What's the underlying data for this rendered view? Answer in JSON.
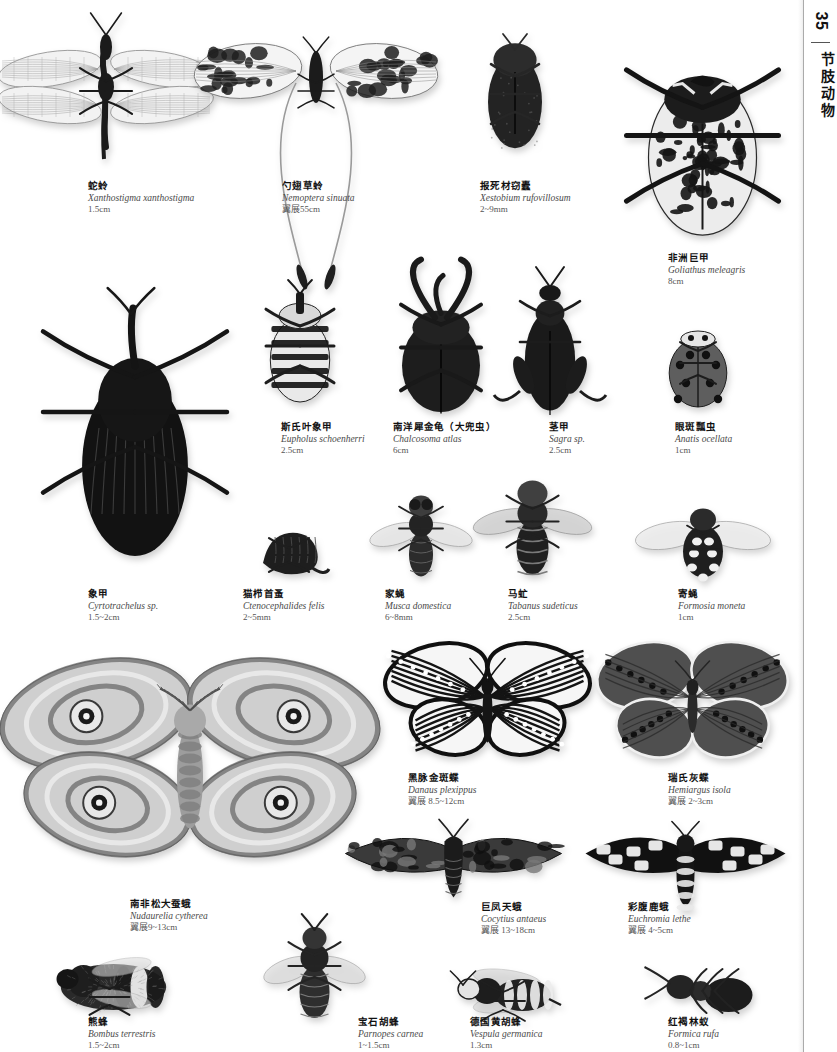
{
  "page": {
    "number": "35",
    "section_label": "节肢动物",
    "background_color": "#ffffff",
    "text_color": "#111111",
    "accent_gray": "#4a4a4a"
  },
  "specimens": [
    {
      "id": "snakefly",
      "cn": "蛇蛉",
      "la": "Xanthostigma xanthostigma",
      "size": "1.5cm",
      "caption_x": 88,
      "caption_y": 180,
      "art_x": 6,
      "art_y": 12,
      "art_w": 200,
      "art_h": 150,
      "kind": "lacewing"
    },
    {
      "id": "spoonwing-lacewing",
      "cn": "勺翅草蛉",
      "la": "Nemoptera sinuata",
      "size": "翼展55cm",
      "caption_x": 282,
      "caption_y": 180,
      "art_x": 196,
      "art_y": 8,
      "art_w": 240,
      "art_h": 230,
      "kind": "nemoptera"
    },
    {
      "id": "deathwatch-beetle",
      "cn": "报死材窃蠹",
      "la": "Xestobium rufovillosum",
      "size": "2~9mm",
      "caption_x": 480,
      "caption_y": 180,
      "art_x": 470,
      "art_y": 20,
      "art_w": 90,
      "art_h": 140,
      "kind": "beetle-dark"
    },
    {
      "id": "goliath-beetle",
      "cn": "非洲巨甲",
      "la": "Goliathus meleagris",
      "size": "8cm",
      "caption_x": 668,
      "caption_y": 252,
      "art_x": 590,
      "art_y": 12,
      "art_w": 225,
      "art_h": 235,
      "kind": "goliath"
    },
    {
      "id": "eupholus-weevil",
      "cn": "斯氏叶象甲",
      "la": "Eupholus schoenherri",
      "size": "2.5cm",
      "caption_x": 281,
      "caption_y": 421,
      "art_x": 245,
      "art_y": 272,
      "art_w": 110,
      "art_h": 140,
      "kind": "weevil-banded"
    },
    {
      "id": "atlas-beetle",
      "cn": "南洋犀金龟（大兜虫）",
      "la": "Chalcosoma atlas",
      "size": "6cm",
      "caption_x": 393,
      "caption_y": 421,
      "art_x": 376,
      "art_y": 258,
      "art_w": 130,
      "art_h": 155,
      "kind": "atlas"
    },
    {
      "id": "sagra-beetle",
      "cn": "茎甲",
      "la": "Sagra sp.",
      "size": "2.5cm",
      "caption_x": 549,
      "caption_y": 421,
      "art_x": 490,
      "art_y": 255,
      "art_w": 120,
      "art_h": 160,
      "kind": "sagra"
    },
    {
      "id": "eyed-ladybird",
      "cn": "眼斑瓢虫",
      "la": "Anatis ocellata",
      "size": "1cm",
      "caption_x": 675,
      "caption_y": 421,
      "art_x": 650,
      "art_y": 315,
      "art_w": 96,
      "art_h": 100,
      "kind": "ladybird"
    },
    {
      "id": "palm-weevil",
      "cn": "象甲",
      "la": "Cyrtotrachelus sp.",
      "size": "1.5~2cm",
      "caption_x": 88,
      "caption_y": 588,
      "art_x": 20,
      "art_y": 272,
      "art_w": 230,
      "art_h": 300,
      "kind": "bigweevil"
    },
    {
      "id": "cat-flea",
      "cn": "猫栉首蚤",
      "la": "Ctenocephalides felis",
      "size": "2~5mm",
      "caption_x": 243,
      "caption_y": 588,
      "art_x": 248,
      "art_y": 512,
      "art_w": 82,
      "art_h": 70,
      "kind": "flea"
    },
    {
      "id": "house-fly",
      "cn": "家蝇",
      "la": "Musca domestica",
      "size": "6~8mm",
      "caption_x": 385,
      "caption_y": 588,
      "art_x": 376,
      "art_y": 478,
      "art_w": 90,
      "art_h": 105,
      "kind": "fly"
    },
    {
      "id": "horse-fly",
      "cn": "马虻",
      "la": "Tabanus sudeticus",
      "size": "2.5cm",
      "caption_x": 508,
      "caption_y": 588,
      "art_x": 480,
      "art_y": 468,
      "art_w": 105,
      "art_h": 115,
      "kind": "horsefly"
    },
    {
      "id": "tachinid-fly",
      "cn": "寄蝇",
      "la": "Formosia moneta",
      "size": "1cm",
      "caption_x": 678,
      "caption_y": 588,
      "art_x": 648,
      "art_y": 490,
      "art_w": 110,
      "art_h": 95,
      "kind": "tachinid"
    },
    {
      "id": "pine-emperor-moth",
      "cn": "南非松大蚕蛾",
      "la": "Nudaurelia cytherea",
      "size": "翼展9~13cm",
      "caption_x": 130,
      "caption_y": 898,
      "art_x": 0,
      "art_y": 628,
      "art_w": 380,
      "art_h": 265,
      "kind": "emperor-moth"
    },
    {
      "id": "monarch-butterfly",
      "cn": "黑脉金斑蝶",
      "la": "Danaus plexippus",
      "size": "翼展 8.5~12cm",
      "caption_x": 408,
      "caption_y": 772,
      "art_x": 385,
      "art_y": 635,
      "art_w": 205,
      "art_h": 135,
      "kind": "monarch"
    },
    {
      "id": "reakirts-blue",
      "cn": "瑞氏灰蝶",
      "la": "Hemiargus isola",
      "size": "翼展 2~3cm",
      "caption_x": 668,
      "caption_y": 772,
      "art_x": 600,
      "art_y": 638,
      "art_w": 185,
      "art_h": 130,
      "kind": "blue-butterfly"
    },
    {
      "id": "giant-sphinx-moth",
      "cn": "巨凤天蛾",
      "la": "Cocytius antaeus",
      "size": "翼展 13~18cm",
      "caption_x": 481,
      "caption_y": 901,
      "art_x": 336,
      "art_y": 808,
      "art_w": 235,
      "art_h": 95,
      "kind": "sphinx-moth"
    },
    {
      "id": "euchromia-moth",
      "cn": "彩腹鹿蛾",
      "la": "Euchromia lethe",
      "size": "翼展 4~5cm",
      "caption_x": 628,
      "caption_y": 901,
      "art_x": 578,
      "art_y": 810,
      "art_w": 215,
      "art_h": 95,
      "kind": "tiger-moth"
    },
    {
      "id": "buff-tailed-bumblebee",
      "cn": "熊蜂",
      "la": "Bombus terrestris",
      "size": "1.5~2cm",
      "caption_x": 88,
      "caption_y": 1016,
      "art_x": 28,
      "art_y": 948,
      "art_w": 155,
      "art_h": 70,
      "kind": "bumblebee"
    },
    {
      "id": "jewel-wasp",
      "cn": "宝石胡蜂",
      "la": "Parnopes carnea",
      "size": "1~1.5cm",
      "caption_x": 358,
      "caption_y": 1016,
      "art_x": 262,
      "art_y": 908,
      "art_w": 105,
      "art_h": 112,
      "kind": "jewel-wasp"
    },
    {
      "id": "german-wasp",
      "cn": "德国黄胡蜂",
      "la": "Vespula germanica",
      "size": "1.3cm",
      "caption_x": 470,
      "caption_y": 1016,
      "art_x": 438,
      "art_y": 960,
      "art_w": 130,
      "art_h": 62,
      "kind": "wasp"
    },
    {
      "id": "red-wood-ant",
      "cn": "红褐林蚁",
      "la": "Formica rufa",
      "size": "0.8~1cm",
      "caption_x": 668,
      "caption_y": 1016,
      "art_x": 640,
      "art_y": 955,
      "art_w": 125,
      "art_h": 68,
      "kind": "ant"
    }
  ]
}
